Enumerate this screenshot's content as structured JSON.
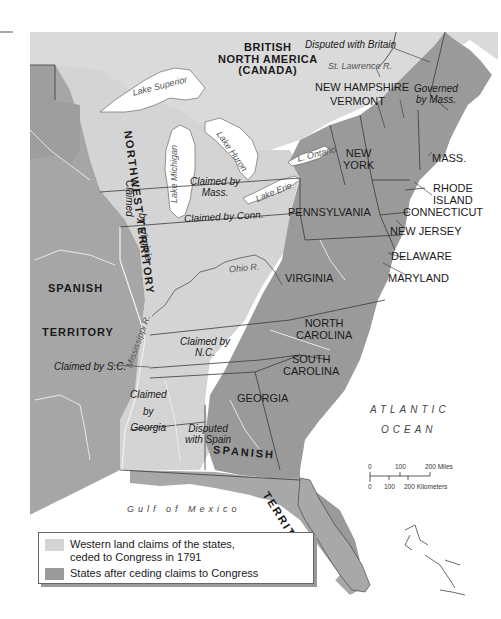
{
  "map": {
    "colors": {
      "western_claims": "#d4d4d4",
      "states": "#9a9a9a",
      "foreign_territory": "#a8a8a8",
      "canada": "#dadada",
      "water": "#ffffff",
      "borders": "#3a3a3a",
      "rivers": "#efefef"
    },
    "regions": {
      "british_north_america": "BRITISH NORTH AMERICA (CANADA)",
      "british_line1": "BRITISH",
      "british_line2": "NORTH AMERICA",
      "british_line3": "(CANADA)",
      "northwest_territory": "NORTHWEST TERRITORY",
      "spanish_territory_west_line1": "SPANISH",
      "spanish_territory_west_line2": "TERRITORY",
      "spanish_territory_south_1": "SPANISH",
      "spanish_territory_south_2": "TERRITORY"
    },
    "states": {
      "new_hampshire": "NEW HAMPSHIRE",
      "vermont": "VERMONT",
      "new_york_1": "NEW",
      "new_york_2": "YORK",
      "mass": "MASS.",
      "rhode_island_1": "RHODE",
      "rhode_island_2": "ISLAND",
      "connecticut": "CONNECTICUT",
      "pennsylvania": "PENNSYLVANIA",
      "new_jersey": "NEW JERSEY",
      "delaware": "DELAWARE",
      "maryland": "MARYLAND",
      "virginia": "VIRGINIA",
      "north_carolina_1": "NORTH",
      "north_carolina_2": "CAROLINA",
      "south_carolina_1": "SOUTH",
      "south_carolina_2": "CAROLINA",
      "georgia": "GEORGIA"
    },
    "claims": {
      "disputed_britain": "Disputed with Britain",
      "governed_mass_1": "Governed",
      "governed_mass_2": "by Mass.",
      "claimed_mass_1": "Claimed by",
      "claimed_mass_2": "Mass.",
      "claimed_conn": "Claimed by Conn.",
      "claimed_virginia_1": "Claimed",
      "claimed_virginia_2": "by",
      "claimed_virginia_3": "Virginia",
      "claimed_nc_1": "Claimed by",
      "claimed_nc_2": "N.C.",
      "claimed_sc": "Claimed by S.C.",
      "claimed_georgia_1": "Claimed",
      "claimed_georgia_2": "by",
      "claimed_georgia_3": "Georgia",
      "disputed_spain_1": "Disputed",
      "disputed_spain_2": "with Spain"
    },
    "water": {
      "lake_superior": "Lake Superior",
      "lake_michigan": "Lake Michigan",
      "lake_huron": "Lake Huron",
      "lake_ontario": "L. Ontario",
      "lake_erie": "Lake Erie",
      "st_lawrence": "St. Lawrence R.",
      "ohio": "Ohio R.",
      "mississippi": "Mississippi R.",
      "gulf": "Gulf of Mexico",
      "atlantic_1": "ATLANTIC",
      "atlantic_2": "OCEAN"
    },
    "scale": {
      "miles_0": "0",
      "miles_100": "100",
      "miles_200": "200 Miles",
      "km_0": "0",
      "km_100": "100",
      "km_200": "200 Kilometers"
    }
  },
  "legend": {
    "items": [
      {
        "label_line1": "Western land claims of the states,",
        "label_line2": "ceded to Congress in 1791",
        "color": "#d4d4d4"
      },
      {
        "label_line1": "States after ceding claims to Congress",
        "color": "#9a9a9a"
      }
    ]
  }
}
